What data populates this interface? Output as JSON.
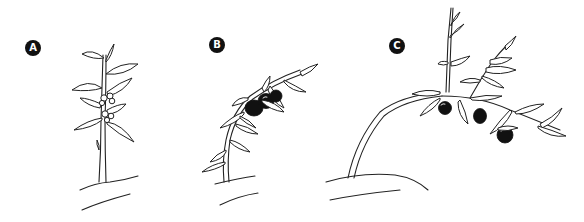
{
  "figure": {
    "panels": [
      {
        "id": "A",
        "label": "A",
        "stage": "flowering plant"
      },
      {
        "id": "B",
        "label": "B",
        "stage": "fruiting plant"
      },
      {
        "id": "C",
        "label": "C",
        "stage": "mature plant bent with fruits"
      }
    ],
    "colors": {
      "ink": "#222222",
      "fruit": "#111111",
      "background": "#ffffff"
    }
  }
}
